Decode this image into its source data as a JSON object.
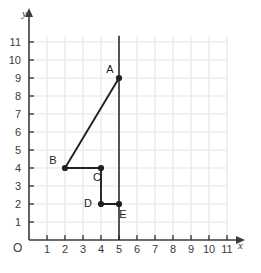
{
  "chart_data": {
    "type": "scatter",
    "title": "",
    "xlabel": "x",
    "ylabel": "y",
    "origin_label": "O",
    "xlim": [
      0,
      11
    ],
    "ylim": [
      0,
      11
    ],
    "xticks": [
      1,
      2,
      3,
      4,
      5,
      6,
      7,
      8,
      9,
      10,
      11
    ],
    "yticks": [
      1,
      2,
      3,
      4,
      5,
      6,
      7,
      8,
      9,
      10,
      11
    ],
    "xtick_labels": [
      "1",
      "2",
      "3",
      "4",
      "5",
      "6",
      "7",
      "8",
      "9",
      "10",
      "11"
    ],
    "ytick_labels": [
      "1",
      "2",
      "3",
      "4",
      "5",
      "6",
      "7",
      "8",
      "9",
      "10",
      "11"
    ],
    "grid": true,
    "grid_color": "#ededed",
    "axis_color": "#3b3b3b",
    "series_color": "#231f20",
    "legend": "none",
    "points": [
      {
        "label": "A",
        "x": 5,
        "y": 9,
        "label_dx": -9,
        "label_dy": -5
      },
      {
        "label": "B",
        "x": 2,
        "y": 4,
        "label_dx": -12,
        "label_dy": -4
      },
      {
        "label": "C",
        "x": 4,
        "y": 4,
        "label_dx": -4,
        "label_dy": 13
      },
      {
        "label": "D",
        "x": 4,
        "y": 2,
        "label_dx": -13,
        "label_dy": 3
      },
      {
        "label": "E",
        "x": 5,
        "y": 2,
        "label_dx": 4,
        "label_dy": 14
      }
    ],
    "segments": [
      {
        "name": "A-B",
        "from": "A",
        "to": "B",
        "x1": 5,
        "y1": 9,
        "x2": 2,
        "y2": 4
      },
      {
        "name": "B-C",
        "from": "B",
        "to": "C",
        "x1": 2,
        "y1": 4,
        "x2": 4,
        "y2": 4
      },
      {
        "name": "C-D",
        "from": "C",
        "to": "D",
        "x1": 4,
        "y1": 4,
        "x2": 4,
        "y2": 2
      },
      {
        "name": "D-E",
        "from": "D",
        "to": "E",
        "x1": 4,
        "y1": 2,
        "x2": 5,
        "y2": 2
      }
    ],
    "vertical_reference_line": {
      "name": "x-equals-5-line",
      "x": 5,
      "y_from": 0,
      "y_to": 11.35
    }
  }
}
